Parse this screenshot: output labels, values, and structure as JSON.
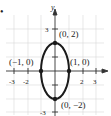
{
  "diagram": {
    "type": "ellipse-graph",
    "bullet": "•",
    "axes": {
      "x_label": "",
      "y_label": "y",
      "x_ticks": [
        "-3",
        "-2",
        "2",
        "3"
      ],
      "y_ticks": [
        "3",
        "-3"
      ],
      "range": {
        "x": [
          -3.5,
          3.8
        ],
        "y": [
          -3.3,
          3.5
        ]
      }
    },
    "ellipse": {
      "center": [
        0,
        0
      ],
      "a": 1,
      "b": 2
    },
    "points": [
      {
        "label": "(0, 2)",
        "x": 0,
        "y": 2
      },
      {
        "label": "(−1, 0)",
        "x": -1,
        "y": 0
      },
      {
        "label": "(1, 0)",
        "x": 1,
        "y": 0
      },
      {
        "label": "(0, −2)",
        "x": 0,
        "y": -2
      }
    ],
    "colors": {
      "curve": "#1a1a1a",
      "grid": "#d9d9d9",
      "axis": "#333333"
    }
  }
}
